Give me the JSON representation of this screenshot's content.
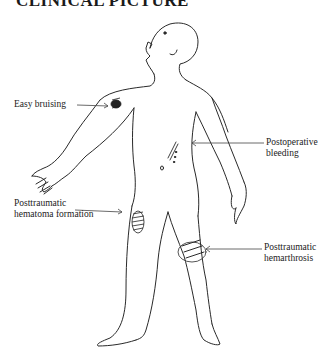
{
  "page": {
    "title": "CLINICAL PICTURE"
  },
  "figure": {
    "labels": [
      {
        "id": "easy-bruising",
        "text": "Easy bruising",
        "site": "upper right arm"
      },
      {
        "id": "postoperative-bleeding",
        "line1": "Postoperative",
        "line2": "bleeding",
        "site": "abdomen"
      },
      {
        "id": "posttraumatic-hematoma",
        "line1": "Posttraumatic",
        "line2": "hematoma formation",
        "site": "right thigh"
      },
      {
        "id": "posttraumatic-hemarthrosis",
        "line1": "Posttraumatic",
        "line2": "hemarthrosis",
        "site": "left knee"
      }
    ],
    "colors": {
      "line": "#2a2a2a",
      "background": "#ffffff"
    }
  }
}
